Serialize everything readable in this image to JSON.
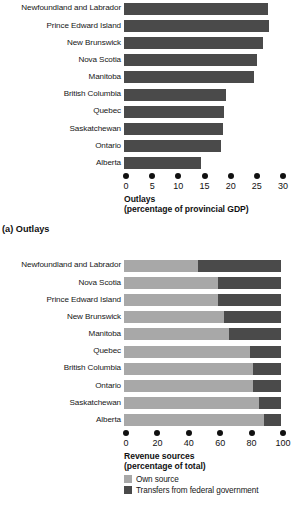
{
  "figure": {
    "panel_a_caption": "(a) Outlays",
    "legend": {
      "own_source": "Own source",
      "transfers": "Transfers from federal government"
    },
    "colors": {
      "bar_dark": "#4a4a4a",
      "bar_light": "#a8a8a8",
      "text": "#161616",
      "background": "#ffffff"
    }
  },
  "chart_data": [
    {
      "type": "bar",
      "orientation": "horizontal",
      "title": "",
      "xlabel": "Outlays (percentage of provincial GDP)",
      "xlabel_line1": "Outlays",
      "xlabel_line2": "(percentage of provincial GDP)",
      "ylabel": "",
      "xlim": [
        0,
        30
      ],
      "xticks": [
        0,
        5,
        10,
        15,
        20,
        25,
        30
      ],
      "xticklabels": [
        "0",
        "5",
        "10",
        "15",
        "20",
        "25",
        "30"
      ],
      "grid": false,
      "legend_position": "none",
      "categories": [
        "Newfoundland and Labrador",
        "Prince Edward Island",
        "New Brunswick",
        "Nova Scotia",
        "Manitoba",
        "British Columbia",
        "Quebec",
        "Saskatchewan",
        "Ontario",
        "Alberta"
      ],
      "values": [
        27.6,
        27.8,
        26.6,
        25.4,
        24.9,
        19.4,
        19.2,
        19.0,
        18.5,
        14.8
      ]
    },
    {
      "type": "bar",
      "orientation": "horizontal",
      "stacked": true,
      "title": "",
      "xlabel": "Revenue sources (percentage of total)",
      "xlabel_line1": "Revenue sources",
      "xlabel_line2": "(percentage of total)",
      "ylabel": "",
      "xlim": [
        0,
        100
      ],
      "xticks": [
        0,
        20,
        40,
        60,
        80,
        100
      ],
      "xticklabels": [
        "0",
        "20",
        "40",
        "60",
        "80",
        "100"
      ],
      "grid": false,
      "legend_position": "bottom",
      "categories": [
        "Newfoundland and Labrador",
        "Nova Scotia",
        "Prince Edward Island",
        "New Brunswick",
        "Manitoba",
        "Quebec",
        "British Columbia",
        "Ontario",
        "Saskatchewan",
        "Alberta"
      ],
      "series": [
        {
          "name": "Own source",
          "values": [
            47,
            60,
            60,
            64,
            67,
            80,
            82,
            82,
            86,
            89
          ]
        },
        {
          "name": "Transfers from federal government",
          "values": [
            53,
            40,
            40,
            36,
            33,
            20,
            18,
            18,
            14,
            11
          ]
        }
      ]
    }
  ]
}
